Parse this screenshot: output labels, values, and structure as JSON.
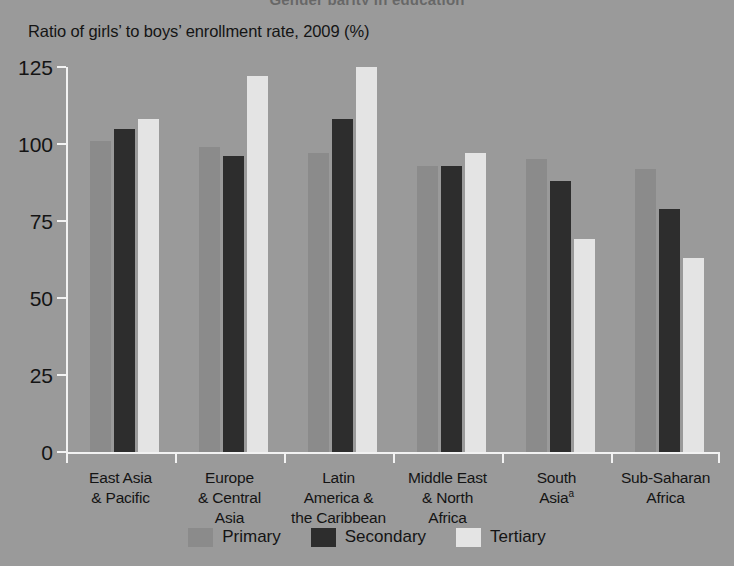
{
  "figure": {
    "clipped_title": "Gender parity in education",
    "subtitle": "Ratio of girls’ to boys’ enrollment rate, 2009 (%)",
    "background_color": "#9a9a9a",
    "axis_color": "#f2f2f2",
    "text_color": "#141414"
  },
  "chart_data": {
    "type": "bar",
    "title": "Ratio of girls’ to boys’ enrollment rate, 2009 (%)",
    "xlabel": "",
    "ylabel": "",
    "ylim": [
      0,
      125
    ],
    "yticks": [
      0,
      25,
      50,
      75,
      100,
      125
    ],
    "ytick_labels": [
      "0",
      "25",
      "50",
      "75",
      "100",
      "125"
    ],
    "grid": false,
    "legend_position": "bottom-center",
    "categories": [
      "East Asia\n& Pacific",
      "Europe\n& Central\nAsia",
      "Latin\nAmerica &\nthe Caribbean",
      "Middle East\n& North\nAfrica",
      "South\nAsiaᵃ",
      "Sub-Saharan\nAfrica"
    ],
    "category_lines": [
      [
        "East Asia",
        "& Pacific"
      ],
      [
        "Europe",
        "& Central",
        "Asia"
      ],
      [
        "Latin",
        "America &",
        "the Caribbean"
      ],
      [
        "Middle East",
        "& North",
        "Africa"
      ],
      [
        "South",
        "Asia"
      ],
      [
        "Sub-Saharan",
        "Africa"
      ]
    ],
    "footnote_marker": "a",
    "footnote_on_category": "South Asia",
    "series": [
      {
        "name": "Primary",
        "color": "#8b8b8b",
        "values": [
          101,
          99,
          97,
          93,
          95,
          92
        ]
      },
      {
        "name": "Secondary",
        "color": "#2d2d2d",
        "values": [
          105,
          96,
          108,
          93,
          88,
          79
        ]
      },
      {
        "name": "Tertiary",
        "color": "#e4e4e4",
        "values": [
          108,
          122,
          125,
          97,
          69,
          63
        ]
      }
    ]
  }
}
